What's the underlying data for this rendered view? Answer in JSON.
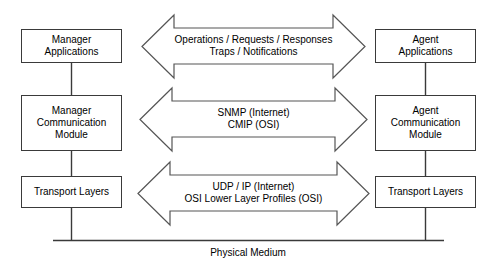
{
  "diagram": {
    "colors": {
      "stroke": "#3a3a3a",
      "arrow_stroke": "#555555",
      "text": "#000000",
      "background": "#ffffff"
    },
    "manager_nodes": [
      {
        "id": "manager-applications",
        "lines": [
          "Manager",
          "Applications"
        ]
      },
      {
        "id": "manager-communication-module",
        "lines": [
          "Manager",
          "Communication",
          "Module"
        ]
      },
      {
        "id": "manager-transport-layers",
        "lines": [
          "Transport Layers"
        ]
      }
    ],
    "agent_nodes": [
      {
        "id": "agent-applications",
        "lines": [
          "Agent",
          "Applications"
        ]
      },
      {
        "id": "agent-communication-module",
        "lines": [
          "Agent",
          "Communication",
          "Module"
        ]
      },
      {
        "id": "agent-transport-layers",
        "lines": [
          "Transport Layers"
        ]
      }
    ],
    "arrows": [
      {
        "id": "application-layer-arrow",
        "lines": [
          "Operations / Requests / Responses",
          "Traps / Notifications"
        ]
      },
      {
        "id": "management-protocol-arrow",
        "lines": [
          "SNMP (Internet)",
          "CMIP (OSI)"
        ]
      },
      {
        "id": "transport-protocol-arrow",
        "lines": [
          "UDP / IP (Internet)",
          "OSI Lower Layer Profiles (OSI)"
        ]
      }
    ],
    "physical_medium": {
      "label": "Physical Medium"
    }
  }
}
